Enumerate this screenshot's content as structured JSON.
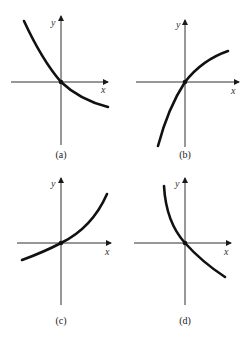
{
  "figure": {
    "panels": [
      {
        "id": "a",
        "caption": "(a)",
        "x_label": "x",
        "y_label": "y",
        "description": "decreasing concave-up curve through origin"
      },
      {
        "id": "b",
        "caption": "(b)",
        "x_label": "x",
        "y_label": "y",
        "description": "increasing concave-down curve through origin"
      },
      {
        "id": "c",
        "caption": "(c)",
        "x_label": "x",
        "y_label": "y",
        "description": "increasing concave-up curve through origin"
      },
      {
        "id": "d",
        "caption": "(d)",
        "x_label": "x",
        "y_label": "y",
        "description": "decreasing concave-up curve through origin, steep on left"
      }
    ]
  },
  "colors": {
    "curve": "#111111",
    "axis": "#1a1a1a",
    "background": "#ffffff"
  }
}
